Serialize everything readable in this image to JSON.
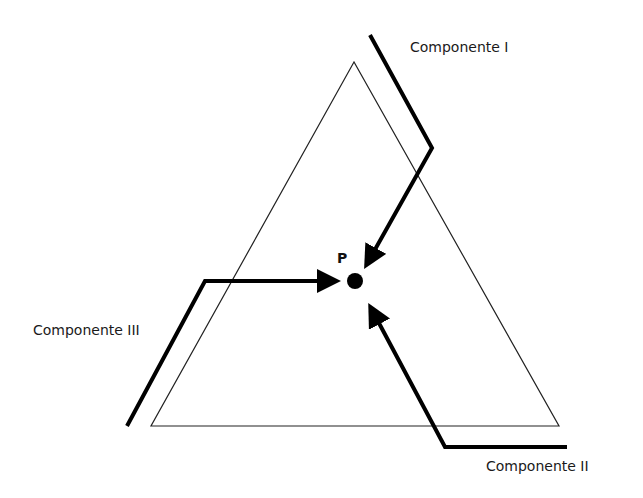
{
  "diagram": {
    "type": "ternary-diagram",
    "point_label": "P",
    "components": [
      {
        "id": "I",
        "label": "Componente I"
      },
      {
        "id": "II",
        "label": "Componente II"
      },
      {
        "id": "III",
        "label": "Componente III"
      }
    ],
    "colors": {
      "line": "#000000",
      "background": "#ffffff"
    }
  }
}
